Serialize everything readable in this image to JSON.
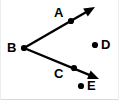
{
  "figure": {
    "kind": "geometry-diagram",
    "background_color": "#ffffff",
    "stroke_color": "#000000",
    "border_color": "#d8d8d8",
    "width": 119,
    "height": 100
  },
  "points": [
    {
      "id": "A",
      "label": "A",
      "dot_x": 71,
      "dot_y": 21,
      "label_x": 54,
      "label_y": 6,
      "on_ray": "BA"
    },
    {
      "id": "B",
      "label": "B",
      "dot_x": 24,
      "dot_y": 48,
      "label_x": 7,
      "label_y": 41,
      "on_ray": "vertex"
    },
    {
      "id": "C",
      "label": "C",
      "dot_x": 74,
      "dot_y": 68,
      "label_x": 54,
      "label_y": 67,
      "on_ray": "BC"
    },
    {
      "id": "D",
      "label": "D",
      "dot_x": 95,
      "dot_y": 45,
      "label_x": 101,
      "label_y": 38,
      "on_ray": "none"
    },
    {
      "id": "E",
      "label": "E",
      "dot_x": 81,
      "dot_y": 86,
      "label_x": 87,
      "label_y": 79,
      "on_ray": "none"
    }
  ],
  "rays": [
    {
      "id": "ray-BA",
      "name": "ray-b-to-a",
      "from": "B",
      "through": "A",
      "start_x": 24,
      "start_y": 48,
      "end_x": 95,
      "end_y": 7,
      "arrowhead": "end"
    },
    {
      "id": "ray-BC",
      "name": "ray-b-to-c",
      "from": "B",
      "through": "C",
      "start_x": 24,
      "start_y": 48,
      "end_x": 99,
      "end_y": 79,
      "arrowhead": "end"
    }
  ],
  "style": {
    "dot_radius": 3.1,
    "line_width": 2.4,
    "label_font_size": 13
  }
}
